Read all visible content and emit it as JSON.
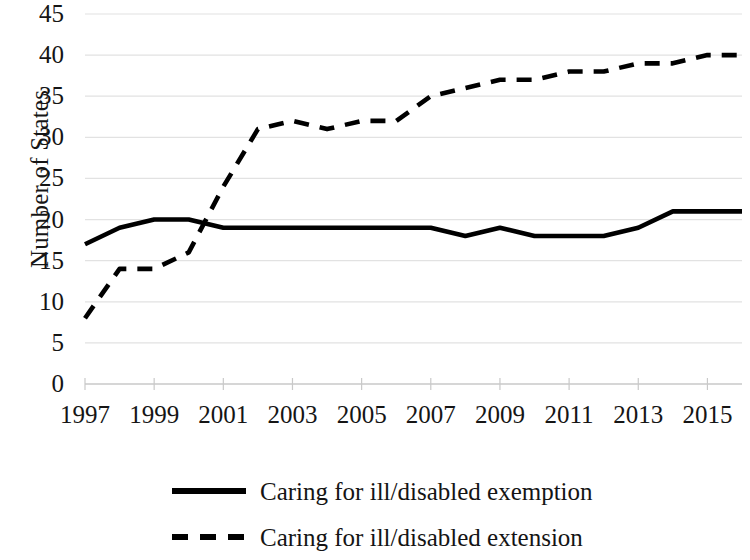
{
  "chart_data": {
    "type": "line",
    "title": "",
    "xlabel": "",
    "ylabel": "Number of States",
    "xlim": [
      1997,
      2016
    ],
    "ylim": [
      0,
      45
    ],
    "grid": true,
    "legend_position": "bottom",
    "x": [
      1997,
      1998,
      1999,
      2000,
      2001,
      2002,
      2003,
      2004,
      2005,
      2006,
      2007,
      2008,
      2009,
      2010,
      2011,
      2012,
      2013,
      2014,
      2015,
      2016
    ],
    "series": [
      {
        "name": "Caring for ill/disabled exemption",
        "style": "solid",
        "color": "#000000",
        "values": [
          17,
          19,
          20,
          20,
          19,
          19,
          19,
          19,
          19,
          19,
          19,
          18,
          19,
          18,
          18,
          18,
          19,
          21,
          21,
          21
        ]
      },
      {
        "name": "Caring for ill/disabled extension",
        "style": "dashed",
        "color": "#000000",
        "values": [
          8,
          14,
          14,
          16,
          24,
          31,
          32,
          31,
          32,
          32,
          35,
          36,
          37,
          37,
          38,
          38,
          39,
          39,
          40,
          40
        ]
      }
    ],
    "y_ticks": [
      0,
      5,
      10,
      15,
      20,
      25,
      30,
      35,
      40,
      45
    ],
    "x_ticks": [
      1997,
      1999,
      2001,
      2003,
      2005,
      2007,
      2009,
      2011,
      2013,
      2015
    ],
    "y_tick_labels": [
      "0",
      "5",
      "10",
      "15",
      "20",
      "25",
      "30",
      "35",
      "40",
      "45"
    ],
    "x_tick_labels": [
      "1997",
      "1999",
      "2001",
      "2003",
      "2005",
      "2007",
      "2009",
      "2011",
      "2013",
      "2015"
    ]
  },
  "axis": {
    "y_title": "Number of States"
  },
  "legend": {
    "items": [
      {
        "label": "Caring for ill/disabled exemption",
        "style": "solid"
      },
      {
        "label": "Caring for ill/disabled extension",
        "style": "dashed"
      }
    ]
  },
  "ticks": {
    "y": [
      "45",
      "40",
      "35",
      "30",
      "25",
      "20",
      "15",
      "10",
      "5",
      "0"
    ],
    "x": [
      "1997",
      "1999",
      "2001",
      "2003",
      "2005",
      "2007",
      "2009",
      "2011",
      "2013",
      "2015"
    ]
  }
}
